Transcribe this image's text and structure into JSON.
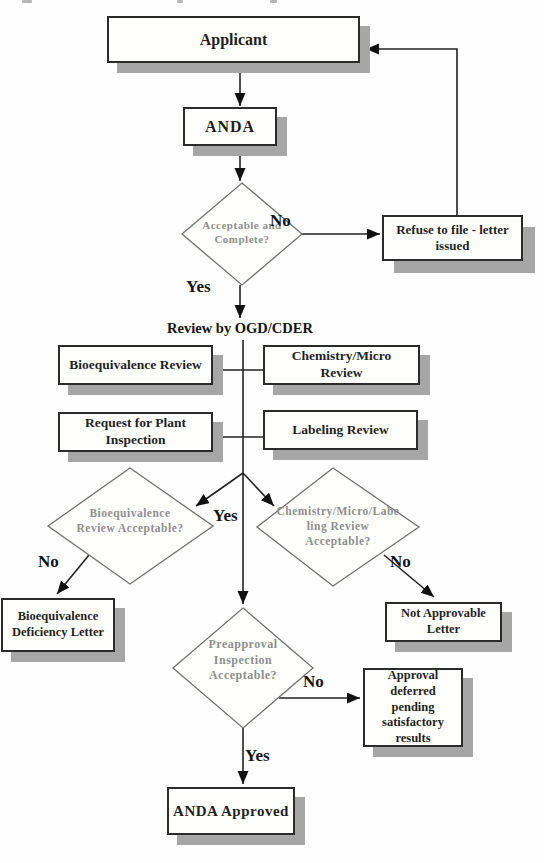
{
  "flowchart": {
    "nodes": {
      "applicant": "Applicant",
      "anda": "ANDA",
      "acceptable_complete": "Acceptable and\nComplete?",
      "refuse_to_file": "Refuse to file - letter\nissued",
      "review_by": "Review by OGD/CDER",
      "bioequivalence_review": "Bioequivalence Review",
      "chemistry_micro_review": "Chemistry/Micro\nReview",
      "request_plant_inspection": "Request for Plant\nInspection",
      "labeling_review": "Labeling Review",
      "bioequivalence_acceptable": "Bioequivalence\nReview Acceptable?",
      "chem_micro_labeling_acceptable": "Chemistry/Micro/Labe\nling Review\nAcceptable?",
      "bioequivalence_deficiency": "Bioequivalence\nDeficiency Letter",
      "not_approvable": "Not Approvable\nLetter",
      "preapproval_inspection": "Preapproval\nInspection\nAcceptable?",
      "approval_deferred": "Approval deferred\npending\nsatisfactory results",
      "anda_approved": "ANDA Approved"
    },
    "edge_labels": {
      "no_file": "No",
      "yes_file": "Yes",
      "yes_reviews": "Yes",
      "no_bioequivalence": "No",
      "no_chem_labeling": "No",
      "no_inspection": "No",
      "yes_inspection": "Yes"
    },
    "colors": {
      "shadow": "#a6a6a6",
      "box_border": "#2b2b2b",
      "diamond_border": "#6f6f6f",
      "diamond_text": "#8d8d8d",
      "text": "#1f1f1f",
      "line": "#222222"
    }
  }
}
